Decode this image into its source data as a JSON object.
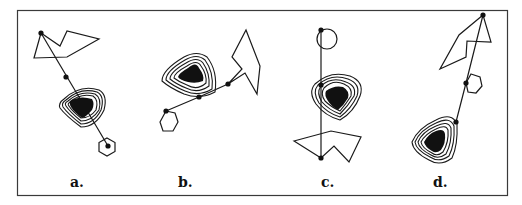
{
  "figure": {
    "panels": [
      {
        "id": "a",
        "label": "a."
      },
      {
        "id": "b",
        "label": "b."
      },
      {
        "id": "c",
        "label": "c."
      },
      {
        "id": "d",
        "label": "d."
      }
    ],
    "colors": {
      "stroke": "#1a1a1a",
      "fill_core": "#111111",
      "frame": "#3a3a3a",
      "background": "#ffffff"
    }
  }
}
